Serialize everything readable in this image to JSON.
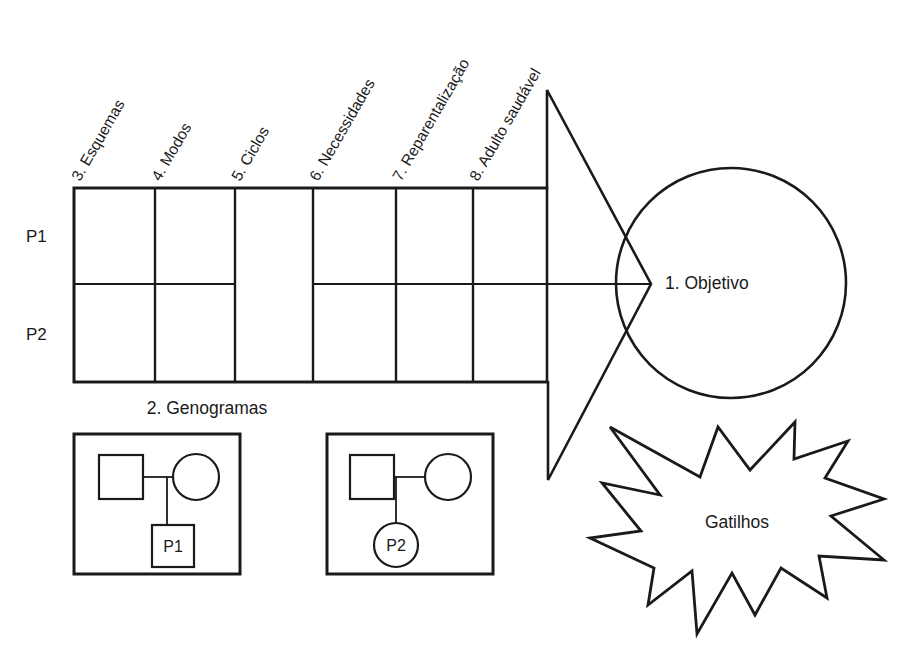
{
  "diagram": {
    "columns": [
      {
        "id": "esquemas",
        "label": "3. Esquemas"
      },
      {
        "id": "modos",
        "label": "4. Modos"
      },
      {
        "id": "ciclos",
        "label": "5. Ciclos"
      },
      {
        "id": "necessidades",
        "label": "6. Necessidades"
      },
      {
        "id": "reparentalizacao",
        "label": "7. Reparentalização"
      },
      {
        "id": "adulto-saudavel",
        "label": "8. Adulto saudável"
      }
    ],
    "rows": [
      {
        "id": "p1",
        "label": "P1"
      },
      {
        "id": "p2",
        "label": "P2"
      }
    ],
    "merged_column_id": "ciclos",
    "objective": {
      "label": "1. Objetivo"
    },
    "trigger": {
      "label": "Gatilhos"
    },
    "genograms": {
      "section_label": "2. Genogramas",
      "items": [
        {
          "id": "genogram-p1",
          "person_label": "P1",
          "person_shape": "square"
        },
        {
          "id": "genogram-p2",
          "person_label": "P2",
          "person_shape": "circle"
        }
      ]
    },
    "colors": {
      "stroke": "#1a1a1a",
      "background": "#ffffff",
      "text": "#1a1a1a"
    }
  }
}
